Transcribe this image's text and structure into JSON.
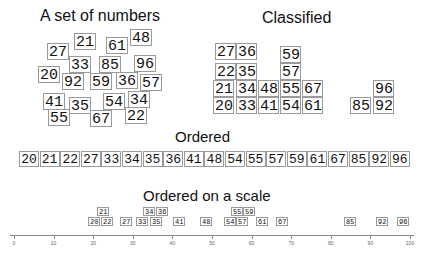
{
  "titles": {
    "set": "A set of numbers",
    "classified": "Classified",
    "ordered": "Ordered",
    "scale": "Ordered on a scale"
  },
  "set": [
    {
      "v": "21",
      "x": 74,
      "y": 33
    },
    {
      "v": "61",
      "x": 106,
      "y": 37
    },
    {
      "v": "48",
      "x": 130,
      "y": 29
    },
    {
      "v": "27",
      "x": 47,
      "y": 43
    },
    {
      "v": "33",
      "x": 69,
      "y": 56
    },
    {
      "v": "85",
      "x": 99,
      "y": 56
    },
    {
      "v": "96",
      "x": 134,
      "y": 55
    },
    {
      "v": "20",
      "x": 38,
      "y": 66
    },
    {
      "v": "92",
      "x": 62,
      "y": 73
    },
    {
      "v": "59",
      "x": 90,
      "y": 73
    },
    {
      "v": "36",
      "x": 116,
      "y": 72
    },
    {
      "v": "57",
      "x": 140,
      "y": 74
    },
    {
      "v": "41",
      "x": 43,
      "y": 93
    },
    {
      "v": "35",
      "x": 69,
      "y": 97
    },
    {
      "v": "54",
      "x": 103,
      "y": 93
    },
    {
      "v": "34",
      "x": 128,
      "y": 91
    },
    {
      "v": "55",
      "x": 48,
      "y": 109
    },
    {
      "v": "67",
      "x": 90,
      "y": 110
    },
    {
      "v": "22",
      "x": 125,
      "y": 107
    }
  ],
  "classified": [
    {
      "v": "27",
      "x": 215,
      "y": 43
    },
    {
      "v": "36",
      "x": 236,
      "y": 43
    },
    {
      "v": "59",
      "x": 280,
      "y": 46
    },
    {
      "v": "22",
      "x": 215,
      "y": 63
    },
    {
      "v": "35",
      "x": 236,
      "y": 63
    },
    {
      "v": "57",
      "x": 280,
      "y": 63
    },
    {
      "v": "21",
      "x": 213,
      "y": 80
    },
    {
      "v": "34",
      "x": 236,
      "y": 80
    },
    {
      "v": "48",
      "x": 258,
      "y": 80
    },
    {
      "v": "55",
      "x": 280,
      "y": 80
    },
    {
      "v": "67",
      "x": 302,
      "y": 80
    },
    {
      "v": "96",
      "x": 373,
      "y": 80
    },
    {
      "v": "20",
      "x": 213,
      "y": 97
    },
    {
      "v": "33",
      "x": 236,
      "y": 97
    },
    {
      "v": "41",
      "x": 258,
      "y": 97
    },
    {
      "v": "54",
      "x": 280,
      "y": 97
    },
    {
      "v": "61",
      "x": 302,
      "y": 97
    },
    {
      "v": "85",
      "x": 350,
      "y": 97
    },
    {
      "v": "92",
      "x": 373,
      "y": 97
    }
  ],
  "ordered": [
    "20",
    "21",
    "22",
    "27",
    "33",
    "34",
    "35",
    "36",
    "41",
    "48",
    "54",
    "55",
    "57",
    "59",
    "61",
    "67",
    "85",
    "92",
    "96"
  ],
  "scale": {
    "ticks": [
      "0",
      "10",
      "20",
      "30",
      "40",
      "50",
      "60",
      "70",
      "80",
      "90",
      "100"
    ],
    "items": [
      {
        "v": "21",
        "x": 97,
        "y": 207
      },
      {
        "v": "20",
        "x": 88,
        "y": 217
      },
      {
        "v": "22",
        "x": 101,
        "y": 217
      },
      {
        "v": "27",
        "x": 120,
        "y": 217
      },
      {
        "v": "33",
        "x": 136,
        "y": 217
      },
      {
        "v": "35",
        "x": 150,
        "y": 217
      },
      {
        "v": "34",
        "x": 143,
        "y": 207
      },
      {
        "v": "36",
        "x": 156,
        "y": 207
      },
      {
        "v": "41",
        "x": 173,
        "y": 217
      },
      {
        "v": "48",
        "x": 200,
        "y": 217
      },
      {
        "v": "54",
        "x": 224,
        "y": 217
      },
      {
        "v": "57",
        "x": 236,
        "y": 217
      },
      {
        "v": "55",
        "x": 231,
        "y": 207
      },
      {
        "v": "59",
        "x": 243,
        "y": 207
      },
      {
        "v": "61",
        "x": 256,
        "y": 217
      },
      {
        "v": "67",
        "x": 276,
        "y": 217
      },
      {
        "v": "85",
        "x": 344,
        "y": 217
      },
      {
        "v": "92",
        "x": 376,
        "y": 217
      },
      {
        "v": "96",
        "x": 397,
        "y": 217
      }
    ]
  },
  "colors": {
    "border": "#9a9a9a",
    "text": "#111111",
    "axis": "#8a8a8a"
  }
}
